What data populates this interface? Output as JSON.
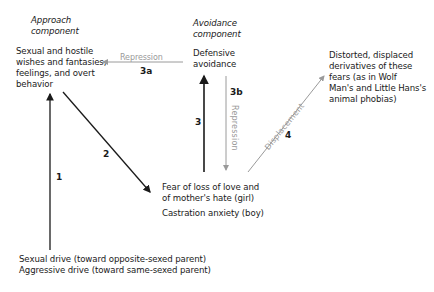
{
  "diagram": {
    "approach": {
      "heading": [
        "Approach",
        "component"
      ],
      "box": [
        "Sexual and hostile",
        "wishes and fantasies,",
        "feelings, and overt",
        "behavior"
      ]
    },
    "avoidance": {
      "heading": [
        "Avoidance",
        "component"
      ],
      "box": [
        "Defensive",
        "avoidance"
      ]
    },
    "derivatives": [
      "Distorted, displaced",
      "derivatives of these",
      "fears (as in Wolf",
      "Man's and Little Hans's",
      "animal phobias)"
    ],
    "fears": {
      "lines": [
        "Fear of loss of love and",
        "of mother's hate (girl)"
      ],
      "boy": "Castration anxiety (boy)"
    },
    "drives": [
      "Sexual drive (toward opposite-sexed parent)",
      "Aggressive drive (toward same-sexed parent)"
    ],
    "arrows": {
      "a1": {
        "label": "1"
      },
      "a2": {
        "label": "2"
      },
      "a3": {
        "label": "3"
      },
      "a3a": {
        "label": "3a",
        "text": "Repression"
      },
      "a3b": {
        "label": "3b",
        "text": "Repression"
      },
      "a4": {
        "label": "4",
        "text": "Displacement"
      }
    },
    "colors": {
      "dark": "#1a1a1a",
      "gray": "#9a9a9a"
    }
  }
}
